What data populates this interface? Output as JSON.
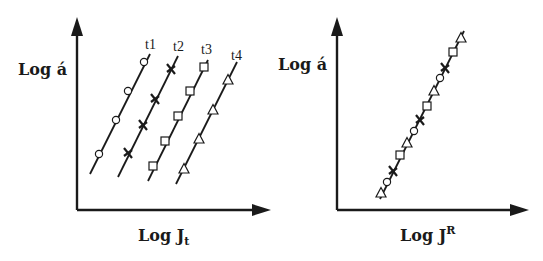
{
  "diagram": {
    "left_panel": {
      "y_axis_label": "Log á",
      "x_axis_label_main": "Log J",
      "x_axis_label_sub": "t",
      "series": [
        {
          "label": "t1",
          "marker": "circle-icon"
        },
        {
          "label": "t2",
          "marker": "cross-icon"
        },
        {
          "label": "t3",
          "marker": "square-icon"
        },
        {
          "label": "t4",
          "marker": "triangle-icon"
        }
      ]
    },
    "right_panel": {
      "y_axis_label": "Log á",
      "x_axis_label_main": "Log J",
      "x_axis_label_sup": "R",
      "description": "All time series collapse onto a single master line"
    },
    "colors": {
      "ink": "#1a1a1a",
      "background": "#ffffff"
    }
  }
}
